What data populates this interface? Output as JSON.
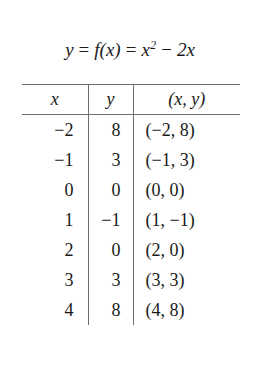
{
  "equation": {
    "lhs": "y",
    "equals_1": "=",
    "function_notation": "f(x)",
    "equals_2": "=",
    "term_base": "x",
    "term_exponent": "2",
    "operator": "−",
    "term_2": "2x",
    "full_text": "y = f(x) = x² − 2x"
  },
  "table": {
    "headers": {
      "x": "x",
      "y": "y",
      "xy": "(x, y)"
    },
    "rows": [
      {
        "x": "−2",
        "y": "8",
        "xy": "(−2, 8)"
      },
      {
        "x": "−1",
        "y": "3",
        "xy": "(−1, 3)"
      },
      {
        "x": "0",
        "y": "0",
        "xy": "(0, 0)"
      },
      {
        "x": "1",
        "y": "−1",
        "xy": "(1, −1)"
      },
      {
        "x": "2",
        "y": "0",
        "xy": "(2, 0)"
      },
      {
        "x": "3",
        "y": "3",
        "xy": "(3, 3)"
      },
      {
        "x": "4",
        "y": "8",
        "xy": "(4, 8)"
      }
    ]
  },
  "colors": {
    "background": "#ffffff",
    "text": "#1a1a1a",
    "rule": "#6e6e6e"
  }
}
